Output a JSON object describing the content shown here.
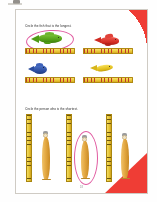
{
  "document": {
    "type": "worksheet-page",
    "page_number": "18",
    "background_color": "#ffffff",
    "page_border_color": "#cfcbc4",
    "accent_color": "#ee2d24",
    "answer_circle_color": "#e05aa0"
  },
  "decorations": {
    "corner_top_right": "red-quarter-circle",
    "corner_bottom_right": "red-triangle"
  },
  "exercises": [
    {
      "id": "q1",
      "instruction": "Circle the fish that is the longest.",
      "items": [
        {
          "name": "green-fish",
          "color": "#5aa81e",
          "circled": true,
          "ruler": "horizontal-tape-measure"
        },
        {
          "name": "red-fish",
          "color": "#d9342b",
          "circled": false,
          "ruler": "horizontal-tape-measure"
        },
        {
          "name": "blue-fish",
          "color": "#2f4fa8",
          "circled": false,
          "ruler": "horizontal-tape-measure"
        },
        {
          "name": "yellow-fish",
          "color": "#e8c21c",
          "circled": false,
          "ruler": "horizontal-tape-measure"
        }
      ]
    },
    {
      "id": "q2",
      "instruction": "Circle the person who is the shortest.",
      "items": [
        {
          "name": "person-1",
          "circled": false,
          "ruler": "vertical-ruler",
          "height": "tall"
        },
        {
          "name": "person-2",
          "circled": true,
          "ruler": "vertical-ruler",
          "height": "short"
        },
        {
          "name": "person-3",
          "circled": false,
          "ruler": "vertical-ruler",
          "height": "medium"
        }
      ]
    }
  ]
}
